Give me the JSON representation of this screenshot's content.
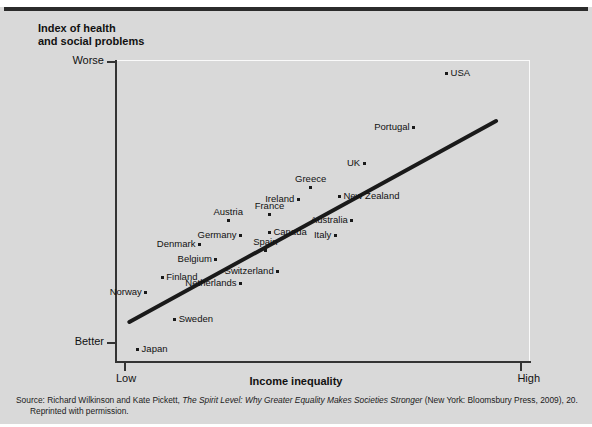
{
  "figure": {
    "background_color": "#d9d9d9",
    "rule_color": "#2b2b2b"
  },
  "axes": {
    "y_title": "Index of health and social problems",
    "y_title_line1": "Index of health",
    "y_title_line2": "and social problems",
    "x_title": "Income inequality",
    "y_tick_top": "Worse",
    "y_tick_bottom": "Better",
    "x_tick_left": "Low",
    "x_tick_right": "High"
  },
  "source": {
    "prefix": "Source: Richard Wilkinson and Kate Pickett, ",
    "italic_title": "The Spirit Level: Why Greater Equality Makes Societies Stronger",
    "suffix": " (New York: Bloomsbury Press, 2009), 20.",
    "line2": "Reprinted with permission."
  },
  "chart_data": {
    "type": "scatter",
    "xlabel": "Income inequality",
    "ylabel": "Index of health and social problems",
    "xlim": [
      0,
      100
    ],
    "ylim": [
      0,
      100
    ],
    "x_axis_ticks": [
      "Low",
      "High"
    ],
    "y_axis_ticks": [
      "Better",
      "Worse"
    ],
    "grid": false,
    "legend": "none",
    "annotation": "A fitted trend line rises from lower-left to upper-right; USA sits far above the line at the extreme top right.",
    "trend_line": {
      "x_start": 3,
      "y_start": 13,
      "x_end": 92,
      "y_end": 80,
      "color": "#1a1a1a",
      "width_px": 4
    },
    "points": [
      {
        "label": "Japan",
        "x": 5,
        "y": 4,
        "label_pos": "right"
      },
      {
        "label": "Norway",
        "x": 7,
        "y": 23,
        "label_pos": "left"
      },
      {
        "label": "Sweden",
        "x": 14,
        "y": 14,
        "label_pos": "right"
      },
      {
        "label": "Finland",
        "x": 11,
        "y": 28,
        "label_pos": "right"
      },
      {
        "label": "Belgium",
        "x": 24,
        "y": 34,
        "label_pos": "left"
      },
      {
        "label": "Denmark",
        "x": 20,
        "y": 39,
        "label_pos": "left"
      },
      {
        "label": "Netherlands",
        "x": 30,
        "y": 26,
        "label_pos": "left"
      },
      {
        "label": "Germany",
        "x": 30,
        "y": 42,
        "label_pos": "left"
      },
      {
        "label": "Austria",
        "x": 27,
        "y": 47,
        "label_pos": "above"
      },
      {
        "label": "Switzerland",
        "x": 39,
        "y": 30,
        "label_pos": "left"
      },
      {
        "label": "Spain",
        "x": 36,
        "y": 37,
        "label_pos": "above"
      },
      {
        "label": "Canada",
        "x": 37,
        "y": 43,
        "label_pos": "right"
      },
      {
        "label": "France",
        "x": 37,
        "y": 49,
        "label_pos": "above"
      },
      {
        "label": "Ireland",
        "x": 44,
        "y": 54,
        "label_pos": "left"
      },
      {
        "label": "Greece",
        "x": 47,
        "y": 58,
        "label_pos": "above"
      },
      {
        "label": "Italy",
        "x": 53,
        "y": 42,
        "label_pos": "left"
      },
      {
        "label": "Australia",
        "x": 57,
        "y": 47,
        "label_pos": "left"
      },
      {
        "label": "New Zealand",
        "x": 54,
        "y": 55,
        "label_pos": "right"
      },
      {
        "label": "UK",
        "x": 60,
        "y": 66,
        "label_pos": "left"
      },
      {
        "label": "Portugal",
        "x": 72,
        "y": 78,
        "label_pos": "left"
      },
      {
        "label": "USA",
        "x": 80,
        "y": 96,
        "label_pos": "right"
      }
    ]
  }
}
